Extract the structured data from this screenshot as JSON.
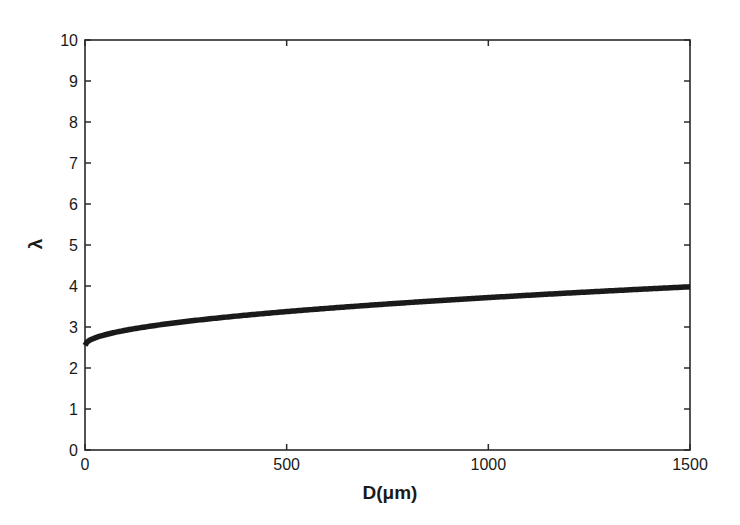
{
  "chart_data": {
    "type": "line",
    "title": "",
    "xlabel": "D(μm)",
    "ylabel": "λ",
    "xlim": [
      0,
      1500
    ],
    "ylim": [
      0,
      10
    ],
    "xticks": [
      0,
      500,
      1000,
      1500
    ],
    "yticks": [
      0,
      1,
      2,
      3,
      4,
      5,
      6,
      7,
      8,
      9,
      10
    ],
    "grid": false,
    "legend": null,
    "series": [
      {
        "name": "λ vs D",
        "color": "#1a1a1a",
        "x": [
          0,
          25,
          50,
          100,
          200,
          300,
          400,
          500,
          600,
          700,
          800,
          900,
          1000,
          1100,
          1200,
          1300,
          1400,
          1500
        ],
        "y": [
          2.55,
          2.73,
          2.81,
          2.92,
          3.07,
          3.19,
          3.29,
          3.37,
          3.45,
          3.52,
          3.59,
          3.66,
          3.72,
          3.78,
          3.83,
          3.88,
          3.93,
          3.98
        ]
      }
    ]
  },
  "axes": {
    "x_label": "D(μm)",
    "y_label": "λ",
    "x_tick_labels": [
      "0",
      "500",
      "1000",
      "1500"
    ],
    "y_tick_labels": [
      "0",
      "1",
      "2",
      "3",
      "4",
      "5",
      "6",
      "7",
      "8",
      "9",
      "10"
    ]
  }
}
